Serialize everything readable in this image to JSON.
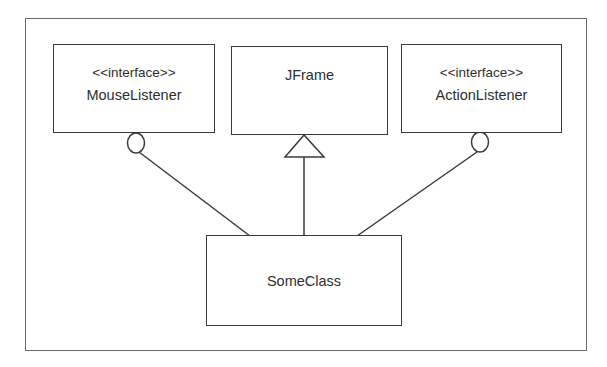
{
  "diagram": {
    "type": "UML class diagram",
    "classes": [
      {
        "id": "mouse_listener",
        "stereotype": "<<interface>>",
        "name": "MouseListener"
      },
      {
        "id": "jframe",
        "stereotype": "",
        "name": "JFrame"
      },
      {
        "id": "action_listener",
        "stereotype": "<<interface>>",
        "name": "ActionListener"
      },
      {
        "id": "some_class",
        "stereotype": "",
        "name": "SomeClass"
      }
    ],
    "relationships": [
      {
        "from": "SomeClass",
        "to": "MouseListener",
        "kind": "interface-realization (lollipop)"
      },
      {
        "from": "SomeClass",
        "to": "JFrame",
        "kind": "generalization (hollow triangle)"
      },
      {
        "from": "SomeClass",
        "to": "ActionListener",
        "kind": "interface-realization (lollipop)"
      }
    ],
    "colors": {
      "line": "#3a3a3a",
      "frame": "#6b6b6b",
      "text": "#2e2e2e",
      "background": "#ffffff"
    }
  }
}
